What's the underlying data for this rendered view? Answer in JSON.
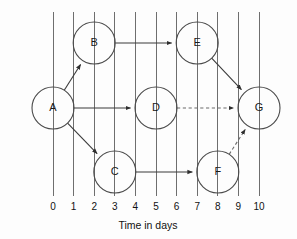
{
  "diagram": {
    "kind": "activity-network-diagram",
    "axis": {
      "title": "Time in days",
      "tick_labels": [
        "0",
        "1",
        "2",
        "3",
        "4",
        "5",
        "6",
        "7",
        "8",
        "9",
        "10"
      ],
      "tick_days": [
        0,
        1,
        2,
        3,
        4,
        5,
        6,
        7,
        8,
        9,
        10
      ],
      "gridlines": 11,
      "grid_color": "#6e6e6e"
    },
    "nodes": [
      {
        "id": "A",
        "label": "A",
        "day": 0,
        "row": "middle"
      },
      {
        "id": "B",
        "label": "B",
        "day": 2,
        "row": "top"
      },
      {
        "id": "C",
        "label": "C",
        "day": 3,
        "row": "bottom"
      },
      {
        "id": "D",
        "label": "D",
        "day": 5,
        "row": "middle"
      },
      {
        "id": "E",
        "label": "E",
        "day": 7,
        "row": "top"
      },
      {
        "id": "F",
        "label": "F",
        "day": 8,
        "row": "bottom"
      },
      {
        "id": "G",
        "label": "G",
        "day": 10,
        "row": "middle"
      }
    ],
    "edges": [
      {
        "from": "A",
        "to": "B",
        "style": "solid",
        "arrow": true
      },
      {
        "from": "A",
        "to": "D",
        "style": "solid",
        "arrow": true
      },
      {
        "from": "A",
        "to": "C",
        "style": "solid",
        "arrow": true
      },
      {
        "from": "B",
        "to": "E",
        "style": "solid",
        "arrow": true
      },
      {
        "from": "C",
        "to": "F",
        "style": "solid",
        "arrow": true
      },
      {
        "from": "E",
        "to": "G",
        "style": "solid",
        "arrow": true
      },
      {
        "from": "D",
        "to": "G",
        "style": "dashed",
        "arrow": true
      },
      {
        "from": "F",
        "to": "G",
        "style": "dashed",
        "arrow": true
      }
    ],
    "colors": {
      "stroke_solid": "#3a3a3a",
      "stroke_dashed": "#6b6b6b",
      "node_stroke": "#4a4a4a",
      "text": "#111111",
      "background": "#fdfdfd"
    }
  }
}
